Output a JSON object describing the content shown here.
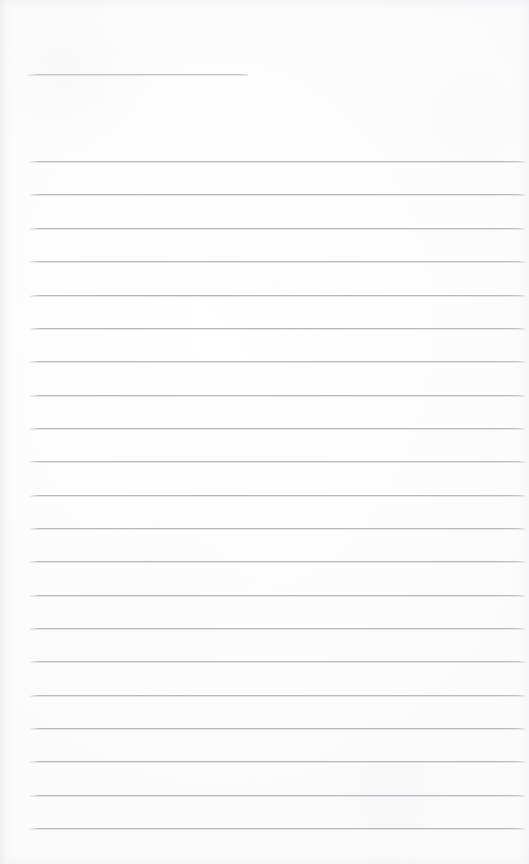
{
  "document": {
    "type": "lined-paper-scan",
    "title": "",
    "page_width": 529,
    "page_height": 864,
    "background_color": "#fefefe",
    "rule_color": "#b9b9bd",
    "content_text": ""
  },
  "header_rule": {
    "name": "header-rule",
    "x": 28,
    "y": 74,
    "width": 220
  },
  "ruled_area": {
    "left": 30,
    "right": 525,
    "first_line_y": 161,
    "line_spacing": 33.4,
    "line_count": 21
  },
  "ruled_lines": [
    {
      "index": 1,
      "y": 161
    },
    {
      "index": 2,
      "y": 194
    },
    {
      "index": 3,
      "y": 228
    },
    {
      "index": 4,
      "y": 261
    },
    {
      "index": 5,
      "y": 295
    },
    {
      "index": 6,
      "y": 328
    },
    {
      "index": 7,
      "y": 361
    },
    {
      "index": 8,
      "y": 395
    },
    {
      "index": 9,
      "y": 428
    },
    {
      "index": 10,
      "y": 461
    },
    {
      "index": 11,
      "y": 495
    },
    {
      "index": 12,
      "y": 528
    },
    {
      "index": 13,
      "y": 561
    },
    {
      "index": 14,
      "y": 595
    },
    {
      "index": 15,
      "y": 628
    },
    {
      "index": 16,
      "y": 661
    },
    {
      "index": 17,
      "y": 695
    },
    {
      "index": 18,
      "y": 728
    },
    {
      "index": 19,
      "y": 761
    },
    {
      "index": 20,
      "y": 795
    },
    {
      "index": 21,
      "y": 828
    }
  ]
}
